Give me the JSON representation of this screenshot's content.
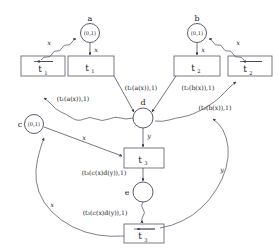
{
  "figure": {
    "background_color": "#ffffff",
    "line_color": "#3a3a4a",
    "box_border_color": "#6a6a7a",
    "text_color": "#1a1a1a"
  },
  "nodes": {
    "a": {
      "name": "a",
      "value": "(0,1)"
    },
    "b": {
      "name": "b",
      "value": "(0,1)"
    },
    "c": {
      "name": "c",
      "value": "(0,1)"
    },
    "d": {
      "name": "d",
      "value": ""
    },
    "e": {
      "name": "e",
      "value": ""
    }
  },
  "boxes": {
    "t1_bar": {
      "label": "t",
      "sub": "1",
      "barred": true
    },
    "t1": {
      "label": "t",
      "sub": "1",
      "barred": false
    },
    "t2": {
      "label": "t",
      "sub": "2",
      "barred": false
    },
    "t2_bar": {
      "label": "t",
      "sub": "2",
      "barred": true
    },
    "t3": {
      "label": "t",
      "sub": "3",
      "barred": false
    },
    "t3_bar": {
      "label": "t",
      "sub": "3",
      "barred": true
    }
  },
  "edge_labels": {
    "x_left_top": "x",
    "x_a_down": "x",
    "x_b_down": "x",
    "x_right_top": "x",
    "x_c_to_t3": "x",
    "x_bottom_left": "x",
    "y_d_to_t3": "y",
    "y_right_side": "y",
    "t1_ax_upper": "(t₁(a(x)),1)",
    "t1_ax_lower": "(t₁(a(x)),1)",
    "t2_bx_upper": "(t₂(b(x)),1)",
    "t2_bx_lower": "(t₂(b(x)),1)",
    "t3_cxdy_upper": "(t₃(c(x)d(y)),1)",
    "t3_cxdy_lower": "(t₃(c(x)d(y)),1)"
  }
}
